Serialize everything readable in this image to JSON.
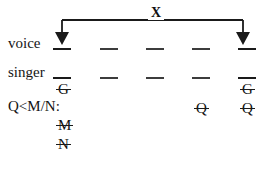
{
  "figure": {
    "type": "autosegmental-tier-diagram",
    "width": 264,
    "height": 172,
    "background": "#ffffff",
    "ink": "#1a1a1a"
  },
  "association": {
    "label": "X",
    "label_x": 155,
    "label_y": 7,
    "left_arrow_x": 62,
    "right_arrow_x": 243,
    "bar_y": 20,
    "arrow_tip_y": 44,
    "description": "horizontal bar with downward arrows at both ends"
  },
  "tiers": [
    {
      "name": "voice",
      "label": "voice",
      "label_x": 8,
      "label_y": 36,
      "slot_y": 48,
      "slots": [
        {
          "x": 53,
          "width": 18,
          "arrow": true
        },
        {
          "x": 100,
          "width": 18,
          "arrow": false
        },
        {
          "x": 146,
          "width": 18,
          "arrow": false
        },
        {
          "x": 192,
          "width": 18,
          "arrow": false
        },
        {
          "x": 238,
          "width": 18,
          "arrow": true
        }
      ]
    },
    {
      "name": "singer",
      "label": "singer",
      "label_x": 8,
      "label_y": 65,
      "slot_y": 77,
      "slots": [
        {
          "x": 53,
          "width": 18,
          "arrow": false
        },
        {
          "x": 100,
          "width": 18,
          "arrow": false
        },
        {
          "x": 146,
          "width": 18,
          "arrow": false
        },
        {
          "x": 192,
          "width": 18,
          "arrow": false
        },
        {
          "x": 238,
          "width": 18,
          "arrow": false
        }
      ]
    }
  ],
  "constraint": {
    "text": "Q<M/N:",
    "x": 8,
    "y": 93
  },
  "segments": [
    {
      "id": "g-left",
      "text": "G",
      "x": 57,
      "y": 79,
      "struck": true
    },
    {
      "id": "g-right",
      "text": "G",
      "x": 241,
      "y": 79,
      "struck": true
    },
    {
      "id": "q-mid",
      "text": "Q",
      "x": 195,
      "y": 95,
      "struck": true
    },
    {
      "id": "q-right",
      "text": "Q",
      "x": 241,
      "y": 95,
      "struck": true
    },
    {
      "id": "m-left",
      "text": "M",
      "x": 57,
      "y": 114,
      "struck": true
    },
    {
      "id": "n-left",
      "text": "N",
      "x": 57,
      "y": 133,
      "struck": true
    }
  ]
}
